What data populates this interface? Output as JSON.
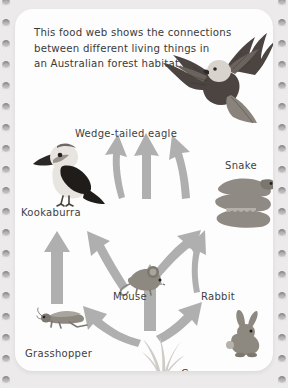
{
  "page": {
    "card_bg": "#fdfdfd",
    "page_bg": "#eceaea",
    "arrow_color": "#b0afaf"
  },
  "intro": {
    "line1": "This food web shows the connections",
    "line2": "between different living things in",
    "line3": "an Australian forest habitat."
  },
  "organisms": [
    {
      "id": "eagle",
      "label": "Wedge-tailed eagle",
      "trophic": "apex predator"
    },
    {
      "id": "kookaburra",
      "label": "Kookaburra",
      "trophic": "predator"
    },
    {
      "id": "snake",
      "label": "Snake",
      "trophic": "predator"
    },
    {
      "id": "mouse",
      "label": "Mouse",
      "trophic": "consumer"
    },
    {
      "id": "rabbit",
      "label": "Rabbit",
      "trophic": "consumer"
    },
    {
      "id": "grasshopper",
      "label": "Grasshopper",
      "trophic": "consumer"
    },
    {
      "id": "grass",
      "label": "Grass",
      "trophic": "producer"
    }
  ],
  "labels": {
    "eagle": "Wedge-tailed eagle",
    "kookaburra": "Kookaburra",
    "snake": "Snake",
    "mouse": "Mouse",
    "rabbit": "Rabbit",
    "grasshopper": "Grasshopper",
    "grass": "Grass"
  },
  "food_web_links": [
    {
      "from": "grass",
      "to": "grasshopper"
    },
    {
      "from": "grass",
      "to": "mouse"
    },
    {
      "from": "grass",
      "to": "rabbit"
    },
    {
      "from": "grasshopper",
      "to": "kookaburra"
    },
    {
      "from": "mouse",
      "to": "kookaburra"
    },
    {
      "from": "mouse",
      "to": "snake"
    },
    {
      "from": "rabbit",
      "to": "snake"
    },
    {
      "from": "kookaburra",
      "to": "eagle"
    },
    {
      "from": "mouse",
      "to": "eagle"
    },
    {
      "from": "snake",
      "to": "eagle"
    }
  ]
}
